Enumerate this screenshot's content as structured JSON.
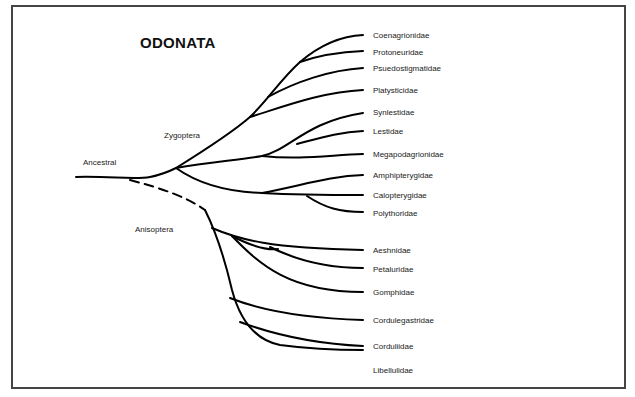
{
  "title": "ODONATA",
  "labels": {
    "ancestral": "Ancestral",
    "zygoptera": "Zygoptera",
    "anisoptera": "Anisoptera"
  },
  "zygoptera_taxa": [
    "Coenagrionidae",
    "Protoneuridae",
    "Psuedostigmatidae",
    "Platysticidae",
    "Synlestidae",
    "Lestidae",
    "Megapodagrionidae",
    "Amphipterygidae",
    "Calopterygidae",
    "Polythoridae"
  ],
  "anisoptera_taxa": [
    "Aeshnidae",
    "Petaluridae",
    "Gomphidae",
    "Cordulegastridae",
    "Corduliidae",
    "Libellulidae"
  ],
  "colors": {
    "line": "#000000",
    "frame": "#444444",
    "text": "#222222"
  }
}
